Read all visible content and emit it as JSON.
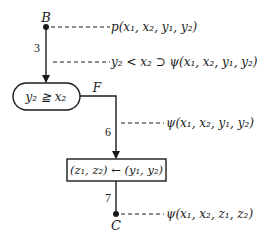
{
  "diagram": {
    "type": "flowchart",
    "nodes": {
      "start": {
        "label": "B"
      },
      "decision": {
        "text": "y₂ ≧ x₂",
        "branch_label": "F"
      },
      "assignment": {
        "text": "(z₁, z₂) ← (y₁, y₂)"
      },
      "end": {
        "label": "C"
      }
    },
    "edges": [
      {
        "label": "3"
      },
      {
        "label": "6"
      },
      {
        "label": "7"
      }
    ],
    "assertions": [
      {
        "text": "p(x₁, x₂, y₁, y₂)"
      },
      {
        "text": "y₂ < x₂ ⊃ ψ(x₁, x₂, y₁, y₂)"
      },
      {
        "text": "ψ(x₁, x₂, y₁, y₂)"
      },
      {
        "text": "ψ(x₁, x₂, z₁, z₂)"
      }
    ],
    "colors": {
      "ink": "#1a1a1a",
      "background": "#ffffff"
    }
  }
}
